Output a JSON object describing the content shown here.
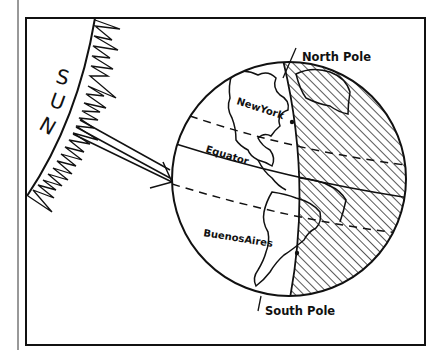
{
  "diagram": {
    "sun_letters": [
      "S",
      "U",
      "N"
    ],
    "labels": {
      "north_pole": "North Pole",
      "south_pole": "South Pole",
      "equator": "Equator",
      "new_york": "NewYork",
      "buenos_aires": "BuenosAires"
    },
    "colors": {
      "ink": "#111111",
      "paper": "#ffffff"
    }
  }
}
